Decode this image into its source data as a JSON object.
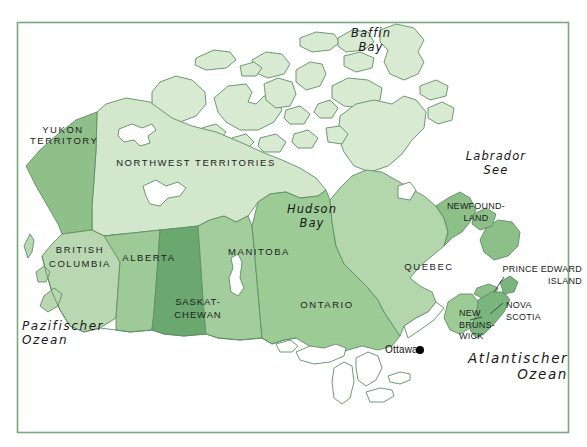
{
  "map": {
    "title": "Kanada — Provinzen und Territorien",
    "frame": {
      "border_color": "#7aa87e",
      "background_color": "#ffffff"
    },
    "palette": {
      "land_outline": "#5e8f63",
      "light_green": "#d9ead3",
      "pale_green": "#cfe3c8",
      "mid_green": "#b7d6b0",
      "medium_green": "#a7cd9f",
      "green": "#93c28c",
      "dark_green": "#7cb67f",
      "darkest_green": "#67a86d",
      "water": "#ffffff",
      "label_color": "#1c1c1c",
      "city_marker": "#000000"
    },
    "provinces": [
      {
        "id": "yukon",
        "label": "YUKON\nTERRITORY",
        "x": 30,
        "y": 124,
        "width": 66,
        "fill": "#8fc089"
      },
      {
        "id": "northwest-territories",
        "label": "NORTHWEST TERRITORIES",
        "x": 106,
        "y": 157,
        "width": 180,
        "fill": "#d2e7cc"
      },
      {
        "id": "british-columbia",
        "label": "BRITISH\nCOLUMBIA",
        "x": 41,
        "y": 243,
        "width": 78,
        "fill": "#b9d8b2"
      },
      {
        "id": "alberta",
        "label": "ALBERTA",
        "x": 113,
        "y": 252,
        "width": 72,
        "fill": "#9dca96"
      },
      {
        "id": "saskatchewan",
        "label": "SASKAT-\nCHEWAN",
        "x": 166,
        "y": 296,
        "width": 64,
        "fill": "#6aa86f"
      },
      {
        "id": "manitoba",
        "label": "MANITOBA",
        "x": 222,
        "y": 246,
        "width": 74,
        "fill": "#a4cd9d"
      },
      {
        "id": "ontario",
        "label": "ONTARIO",
        "x": 292,
        "y": 299,
        "width": 70,
        "fill": "#9ccb96"
      },
      {
        "id": "quebec",
        "label": "QUEBEC",
        "x": 396,
        "y": 261,
        "width": 66,
        "fill": "#b4d6ad"
      },
      {
        "id": "newfoundland",
        "label": "NEWFOUND-\nLAND",
        "x": 446,
        "y": 201,
        "width": 60,
        "fill": "#8cc088"
      },
      {
        "id": "prince-edward-island",
        "label": "PRINCE EDWARD\nISLAND",
        "x": 487,
        "y": 264,
        "width": 95,
        "fill": "#8cc088"
      },
      {
        "id": "nova-scotia",
        "label": "NOVA\nSCOTIA",
        "x": 506,
        "y": 300,
        "width": 44,
        "fill": "#79b57d"
      },
      {
        "id": "new-brunswick",
        "label": "NEW\nBRUNS-\nWICK",
        "x": 459,
        "y": 308,
        "width": 38,
        "fill": "#9ccb96"
      }
    ],
    "water_labels": [
      {
        "id": "baffin-bay",
        "label": "Baffin\nBay",
        "x": 334,
        "y": 27,
        "width": 74
      },
      {
        "id": "hudson-bay",
        "label": "Hudson\nBay",
        "x": 275,
        "y": 203,
        "width": 74
      },
      {
        "id": "labrador-sea",
        "label": "Labrador\nSee",
        "x": 455,
        "y": 150,
        "width": 82
      }
    ],
    "ocean_labels": [
      {
        "id": "pacific-ocean",
        "label": "Pazifischer\nOzean",
        "x": 22,
        "y": 319,
        "align": "left"
      },
      {
        "id": "atlantic-ocean",
        "label": "Atlantischer\nOzean",
        "x": 468,
        "y": 351,
        "align": "left"
      }
    ],
    "cities": [
      {
        "id": "ottawa",
        "label": "Ottawa",
        "label_x": 385,
        "label_y": 344,
        "dot_x": 420,
        "dot_y": 350,
        "dot_r": 4
      }
    ]
  }
}
